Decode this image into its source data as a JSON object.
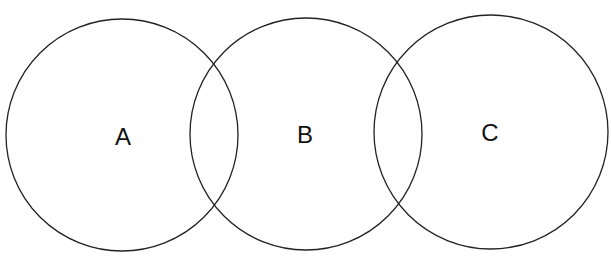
{
  "diagram": {
    "type": "venn-chain",
    "stroke_color": "#222222",
    "background": "#ffffff",
    "circles": [
      {
        "id": "A",
        "label": "A",
        "cx": 122,
        "cy": 135,
        "r": 116
      },
      {
        "id": "B",
        "label": "B",
        "cx": 306,
        "cy": 134,
        "r": 116
      },
      {
        "id": "C",
        "label": "C",
        "cx": 491,
        "cy": 132,
        "r": 117
      }
    ]
  }
}
